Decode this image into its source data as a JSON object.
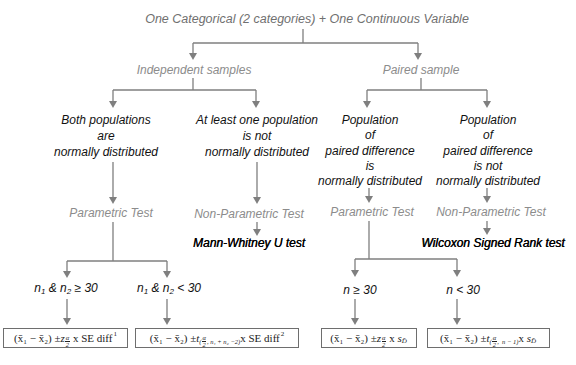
{
  "diagram": {
    "title": "One Categorical (2 categories) + One Continuous Variable",
    "branches": {
      "independent": {
        "label": "Independent samples",
        "normal": {
          "lines": [
            "Both populations",
            "are",
            "normally distributed"
          ],
          "test_type": "Parametric Test",
          "conditions": [
            {
              "n_a": "n",
              "sub_a": "1",
              "amp": " & n",
              "sub_b": "2",
              "op": " ≥ 30"
            },
            {
              "n_a": "n",
              "sub_a": "1",
              "amp": " & n",
              "sub_b": "2",
              "op": " < 30"
            }
          ]
        },
        "not_normal": {
          "lines": [
            "At least one population",
            "is not",
            "normally distributed"
          ],
          "test_type": "Non-Parametric Test",
          "test": "Mann-Whitney U test"
        }
      },
      "paired": {
        "label": "Paired sample",
        "normal": {
          "lines": [
            "Population",
            "of",
            "paired difference",
            "is",
            "normally distributed"
          ],
          "test_type": "Parametric Test",
          "conditions": [
            {
              "text": "n ≥ 30"
            },
            {
              "text": "n < 30"
            }
          ]
        },
        "not_normal": {
          "lines": [
            "Population",
            "of",
            "paired difference",
            "is not",
            "normally distributed"
          ],
          "test_type": "Non-Parametric Test",
          "test": "Wilcoxon Signed Rank test"
        }
      }
    },
    "formulas": [
      {
        "diff": "(x̄₁ − x̄₂) ± ",
        "stat": "z",
        "sub_open": "",
        "frac_num": "α",
        "frac_den": "2",
        "sub_rest": "",
        "times": " x ",
        "se": "SE diff",
        "se_sub": "",
        "note": "1"
      },
      {
        "diff": "(x̄₁ − x̄₂) ± ",
        "stat": "t",
        "sub_open": "(",
        "frac_num": "α",
        "frac_den": "2",
        "sub_rest": ", n₁ + n₂ −2)",
        "times": "x ",
        "se": "SE diff",
        "se_sub": "",
        "note": "2"
      },
      {
        "diff": "(x̄₁ − x̄₂) ± ",
        "stat": "z",
        "sub_open": "",
        "frac_num": "α",
        "frac_den": "2",
        "sub_rest": "",
        "times": " x ",
        "se": "s",
        "se_sub": "D̄",
        "note": ""
      },
      {
        "diff": "(x̄₁ − x̄₂) ± ",
        "stat": "t",
        "sub_open": "(",
        "frac_num": "α",
        "frac_den": "2",
        "sub_rest": ",  n − 1)",
        "times": "x ",
        "se": "s",
        "se_sub": "D̄",
        "note": ""
      }
    ],
    "colors": {
      "connector": "#7f7f7f",
      "label_gray": "#8c8c8c",
      "title_gray": "#707070",
      "text": "#111111"
    }
  }
}
